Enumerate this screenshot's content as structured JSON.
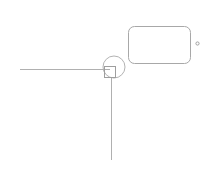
{
  "canvas": {
    "width": 210,
    "height": 169,
    "background_color": "#ffffff",
    "stroke_color": "#b3b3b3",
    "stroke_color_dark": "#9e9e9e",
    "stroke_width": 1
  },
  "diagram": {
    "title": "",
    "shapes": [
      {
        "name": "horizontal-connector-line",
        "kind": "line",
        "label": "",
        "x1": 20,
        "y1": 69.5,
        "x2": 110,
        "y2": 69.5,
        "color": "#b0b0b0",
        "width": 1
      },
      {
        "name": "vertical-connector-line",
        "kind": "line",
        "label": "",
        "x1": 111.5,
        "y1": 78,
        "x2": 111.5,
        "y2": 160,
        "color": "#b0b0b0",
        "width": 1
      },
      {
        "name": "junction-circle",
        "kind": "circle",
        "label": "",
        "cx": 114,
        "cy": 67,
        "r": 11,
        "color": "#b3b3b3",
        "width": 1
      },
      {
        "name": "junction-square",
        "kind": "rect",
        "label": "",
        "x": 104.5,
        "y": 66.5,
        "width": 11,
        "height": 11,
        "rx": 0,
        "color": "#9e9e9e",
        "stroke_width": 1
      },
      {
        "name": "rounded-rectangle-panel",
        "kind": "rect",
        "label": "",
        "x": 128.5,
        "y": 26.5,
        "width": 62,
        "height": 37,
        "rx": 6,
        "color": "#a8a8a8",
        "stroke_width": 1
      },
      {
        "name": "dot-marker",
        "kind": "dot",
        "label": "",
        "cx": 197.5,
        "cy": 43.5,
        "r": 1.6,
        "color": "#a0a0a0",
        "width": 1
      }
    ]
  }
}
